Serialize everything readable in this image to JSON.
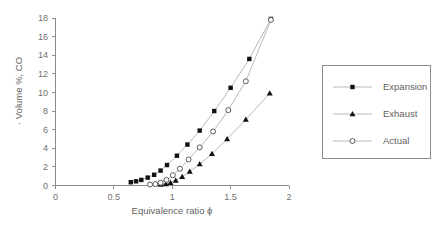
{
  "chart_data": {
    "type": "scatter",
    "title": "",
    "xlabel": "Equivalence ratio ϕ",
    "ylabel": "· Volume %, CO",
    "xlim": [
      0,
      2
    ],
    "ylim": [
      0,
      18
    ],
    "xticks": [
      "0",
      "0.5",
      "1",
      "1.5",
      "2"
    ],
    "xtick_values": [
      0,
      0.5,
      1,
      1.5,
      2
    ],
    "yticks": [
      "0",
      "2",
      "4",
      "6",
      "8",
      "10",
      "12",
      "14",
      "16",
      "18"
    ],
    "ytick_values": [
      0,
      2,
      4,
      6,
      8,
      10,
      12,
      14,
      16,
      18
    ],
    "grid": false,
    "legend_position": "right",
    "series": [
      {
        "name": "Expansion",
        "marker": "filled-square",
        "x": [
          0.645,
          0.69,
          0.735,
          0.79,
          0.845,
          0.9,
          0.955,
          1.04,
          1.13,
          1.235,
          1.36,
          1.5,
          1.66,
          1.845
        ],
        "y": [
          0.35,
          0.45,
          0.6,
          0.85,
          1.15,
          1.6,
          2.2,
          3.2,
          4.4,
          5.9,
          8.0,
          10.5,
          13.6,
          17.9
        ]
      },
      {
        "name": "Exhaust",
        "marker": "filled-triangle",
        "x": [
          0.9,
          0.945,
          0.985,
          1.03,
          1.085,
          1.15,
          1.235,
          1.34,
          1.47,
          1.63,
          1.835
        ],
        "y": [
          0.1,
          0.15,
          0.3,
          0.55,
          0.95,
          1.5,
          2.3,
          3.4,
          5.0,
          7.1,
          9.9
        ]
      },
      {
        "name": "Actual",
        "marker": "open-circle",
        "x": [
          0.81,
          0.855,
          0.9,
          0.95,
          1.005,
          1.065,
          1.14,
          1.235,
          1.35,
          1.48,
          1.63,
          1.845
        ],
        "y": [
          0.1,
          0.15,
          0.3,
          0.6,
          1.1,
          1.8,
          2.8,
          4.1,
          5.8,
          8.1,
          11.2,
          17.8
        ]
      }
    ]
  },
  "legend": {
    "items": [
      {
        "label": "Expansion",
        "marker": "filled-square"
      },
      {
        "label": "Exhaust",
        "marker": "filled-triangle"
      },
      {
        "label": "Actual",
        "marker": "open-circle"
      }
    ]
  }
}
